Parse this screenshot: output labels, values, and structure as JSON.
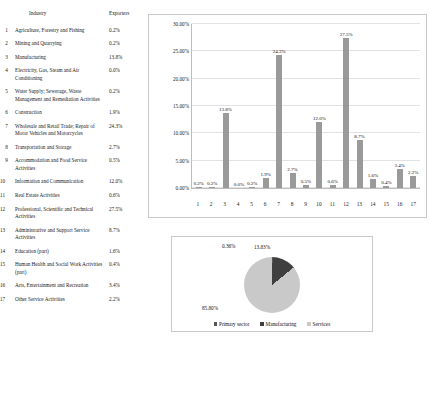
{
  "table": {
    "headers": {
      "num": "",
      "industry": "Industry",
      "exporters": "Exporters"
    },
    "rows": [
      {
        "num": "1",
        "industry": "Agriculture, Forestry and Fishing",
        "value": "0.2%"
      },
      {
        "num": "2",
        "industry": "Mining and Quarrying",
        "value": "0.2%"
      },
      {
        "num": "3",
        "industry": "Manufacturing",
        "value": "13.8%"
      },
      {
        "num": "4",
        "industry": "Electricity, Gas, Steam and Air Conditioning",
        "value": "0.0%"
      },
      {
        "num": "5",
        "industry": "Water Supply; Sewerage, Waste Management and Remediation Activities",
        "value": "0.2%"
      },
      {
        "num": "6",
        "industry": "Construction",
        "value": "1.9%"
      },
      {
        "num": "7",
        "industry": "Wholesale and Retail Trade; Repair of Motor Vehicles and Motorcycles",
        "value": "24.3%"
      },
      {
        "num": "8",
        "industry": "Transportation and Storage",
        "value": "2.7%"
      },
      {
        "num": "9",
        "industry": "Accommodation and Food Service Activities",
        "value": "0.5%"
      },
      {
        "num": "10",
        "industry": "Information and Communication",
        "value": "12.0%"
      },
      {
        "num": "11",
        "industry": "Real Estate Activities",
        "value": "0.6%"
      },
      {
        "num": "12",
        "industry": "Professional, Scientific and Technical Activities",
        "value": "27.5%"
      },
      {
        "num": "13",
        "industry": "Administrative and Support Service Activities",
        "value": "8.7%"
      },
      {
        "num": "14",
        "industry": "Education (part)",
        "value": "1.6%"
      },
      {
        "num": "15",
        "industry": "Human Health and Social Work Activities (part)",
        "value": "0.4%"
      },
      {
        "num": "16",
        "industry": "Arts, Entertainment and Recreation",
        "value": "3.4%"
      },
      {
        "num": "17",
        "industry": "Other Service Activities",
        "value": "2.2%"
      }
    ]
  },
  "chart_data": [
    {
      "type": "bar",
      "title": "",
      "xlabel": "",
      "ylabel": "",
      "categories": [
        "1",
        "2",
        "3",
        "4",
        "5",
        "6",
        "7",
        "8",
        "9",
        "10",
        "11",
        "12",
        "13",
        "14",
        "15",
        "16",
        "17"
      ],
      "values": [
        0.2,
        0.2,
        13.8,
        0.0,
        0.2,
        1.9,
        24.3,
        2.7,
        0.5,
        12.0,
        0.6,
        27.5,
        8.7,
        1.6,
        0.4,
        3.4,
        2.2
      ],
      "data_labels": [
        "0.2%",
        "0.2%",
        "13.8%",
        "0.0%",
        "0.2%",
        "1.9%",
        "24.3%",
        "2.7%",
        "0.5%",
        "12.0%",
        "0.6%",
        "27.5%",
        "8.7%",
        "1.6%",
        "0.4%",
        "3.4%",
        "2.2%"
      ],
      "ytick_labels": [
        "30.00%",
        "25.00%",
        "20.00%",
        "15.00%",
        "10.00%",
        "5.00%",
        "0.00%"
      ],
      "ytick_values": [
        30,
        25,
        20,
        15,
        10,
        5,
        0
      ],
      "ylim": [
        0,
        30
      ],
      "grid": true,
      "legend": "none",
      "series_color": "#9a9a9a"
    },
    {
      "type": "pie",
      "title": "",
      "labels": [
        "Primary sector",
        "Manufacturing",
        "Services"
      ],
      "values": [
        0.36,
        13.83,
        85.8
      ],
      "data_labels": [
        "0.36%",
        "13.83%",
        "85.80%"
      ],
      "colors": [
        "#585858",
        "#3f3f3f",
        "#c9c9c9"
      ],
      "legend": "bottom"
    }
  ]
}
